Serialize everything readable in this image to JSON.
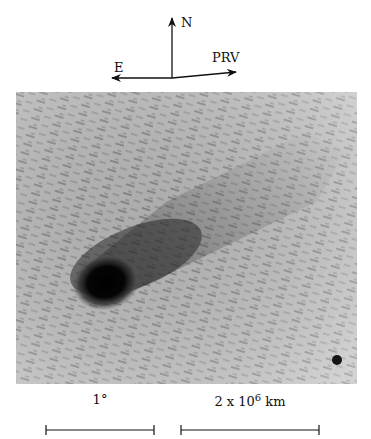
{
  "figure": {
    "compass": {
      "north_label": "N",
      "east_label": "E",
      "prv_label": "PRV"
    },
    "image": {
      "description": "Comet image with dark nucleus and coma, tail extending toward upper right; streaked star trails background",
      "features": [
        "comet-nucleus",
        "comet-tail",
        "field-star"
      ]
    },
    "scale_bars": [
      {
        "label": "1°"
      },
      {
        "label_base": "2 x 10",
        "label_exp": "6",
        "label_unit": " km"
      }
    ]
  }
}
